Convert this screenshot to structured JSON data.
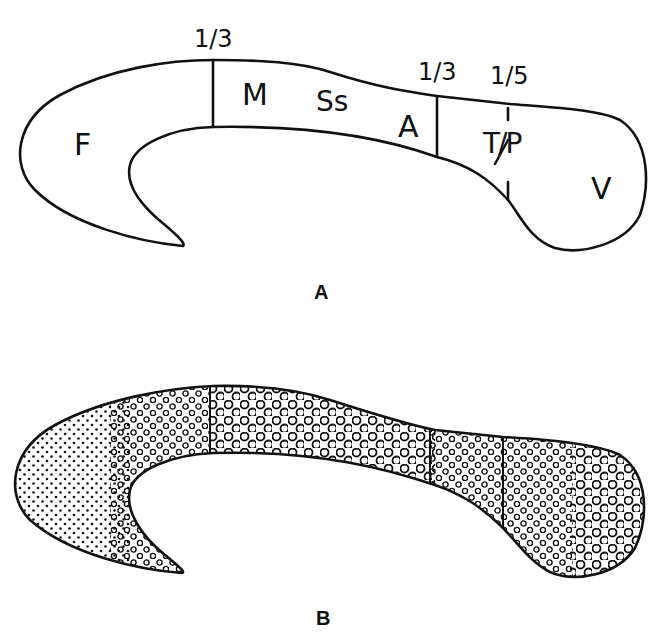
{
  "figure": {
    "panels": [
      {
        "id": "A",
        "label": "A",
        "regions": [
          {
            "key": "F",
            "label": "F"
          },
          {
            "key": "M",
            "label": "M"
          },
          {
            "key": "Ss",
            "label": "Ss"
          },
          {
            "key": "A",
            "label": "A"
          },
          {
            "key": "TP",
            "label": "T/P"
          },
          {
            "key": "V",
            "label": "V"
          }
        ],
        "boundaries": [
          {
            "label": "1/3"
          },
          {
            "label": "1/3"
          },
          {
            "label": "1/5"
          }
        ]
      },
      {
        "id": "B",
        "label": "B",
        "description": "Same outline filled with stipple: fine dots anteriorly, grading to large open circles in middle and posterior segments"
      }
    ]
  }
}
